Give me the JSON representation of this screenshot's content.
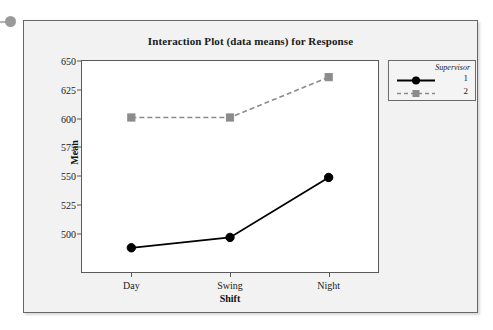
{
  "chart_data": {
    "type": "line",
    "title": "Interaction Plot (data means) for Response",
    "xlabel": "Shift",
    "ylabel": "Mean",
    "categories": [
      "Day",
      "Swing",
      "Night"
    ],
    "ylim": [
      467,
      650
    ],
    "yticks": [
      500,
      525,
      550,
      575,
      600,
      625,
      650
    ],
    "ytick_labels": [
      "500",
      "525",
      "550",
      "575",
      "600",
      "625",
      "650"
    ],
    "grid": false,
    "legend_position": "right",
    "legend_title": "Supervisor",
    "series": [
      {
        "name": "1",
        "values": [
          488,
          497,
          549
        ],
        "color": "#000000",
        "line_style": "solid",
        "marker": "circle"
      },
      {
        "name": "2",
        "values": [
          601,
          601,
          636
        ],
        "color": "#8c8c8c",
        "line_style": "dashed",
        "marker": "square"
      }
    ]
  },
  "colors": {
    "series1": "#000000",
    "series2": "#8c8c8c",
    "axis": "#5a5a5a",
    "window_bg": "#f2f2f2",
    "plot_bg": "#ffffff",
    "legend_bg": "#f4f4f4"
  },
  "decor": {
    "bullet": "bullet-dot"
  }
}
